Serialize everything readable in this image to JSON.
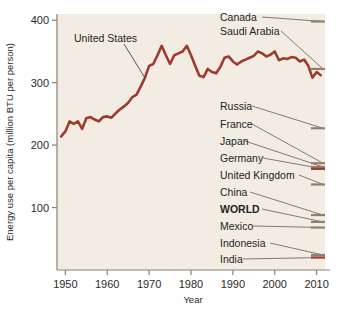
{
  "chart_data": {
    "type": "line",
    "title": "",
    "xlabel": "Year",
    "ylabel": "Energy use per capita (million BTU per person)",
    "xlim": [
      1948,
      2012
    ],
    "ylim": [
      0,
      410
    ],
    "xticks": [
      1950,
      1960,
      1970,
      1980,
      1990,
      2000,
      2010
    ],
    "yticks": [
      100,
      200,
      300,
      400
    ],
    "grid": false,
    "legend_position": "right-inline-labels",
    "line_color": "#9e3b2e",
    "plot_background": "#f3ece2",
    "series": [
      {
        "name": "United States",
        "color": "#9e3b2e",
        "x": [
          1949,
          1950,
          1951,
          1952,
          1953,
          1954,
          1955,
          1956,
          1957,
          1958,
          1959,
          1960,
          1961,
          1962,
          1963,
          1964,
          1965,
          1966,
          1967,
          1968,
          1969,
          1970,
          1971,
          1972,
          1973,
          1974,
          1975,
          1976,
          1977,
          1978,
          1979,
          1980,
          1981,
          1982,
          1983,
          1984,
          1985,
          1986,
          1987,
          1988,
          1989,
          1990,
          1991,
          1992,
          1993,
          1994,
          1995,
          1996,
          1997,
          1998,
          1999,
          2000,
          2001,
          2002,
          2003,
          2004,
          2005,
          2006,
          2007,
          2008,
          2009,
          2010,
          2011
        ],
        "values": [
          214,
          222,
          238,
          234,
          238,
          226,
          243,
          245,
          241,
          238,
          245,
          246,
          244,
          251,
          257,
          262,
          268,
          277,
          281,
          294,
          308,
          327,
          330,
          344,
          359,
          344,
          330,
          344,
          347,
          350,
          359,
          344,
          327,
          311,
          309,
          322,
          317,
          315,
          325,
          340,
          342,
          334,
          329,
          334,
          337,
          340,
          343,
          350,
          347,
          342,
          345,
          350,
          336,
          339,
          338,
          341,
          340,
          334,
          337,
          327,
          308,
          317,
          312
        ]
      },
      {
        "name": "Canada",
        "color": "#8c8075",
        "endpoint_value": 398,
        "label_leader": true
      },
      {
        "name": "Saudi Arabia",
        "color": "#8c8075",
        "endpoint_value": 322,
        "label_leader": true
      },
      {
        "name": "Russia",
        "color": "#8c8075",
        "endpoint_value": 227,
        "label_leader": true
      },
      {
        "name": "France",
        "color": "#8c8075",
        "endpoint_value": 171,
        "label_leader": true
      },
      {
        "name": "Japan",
        "color": "#8c8075",
        "endpoint_value": 165,
        "label_leader": true
      },
      {
        "name": "Germany",
        "color": "#9e3b2e",
        "endpoint_value": 162,
        "label_leader": true
      },
      {
        "name": "United Kingdom",
        "color": "#8c8075",
        "endpoint_value": 137,
        "label_leader": true
      },
      {
        "name": "China",
        "color": "#8c8075",
        "endpoint_value": 88,
        "label_leader": true
      },
      {
        "name": "WORLD",
        "color": "#8c8075",
        "endpoint_value": 77,
        "label_leader": true,
        "emphasis": "bold"
      },
      {
        "name": "Mexico",
        "color": "#8c8075",
        "endpoint_value": 68,
        "label_leader": true
      },
      {
        "name": "Indonesia",
        "color": "#8c8075",
        "endpoint_value": 24,
        "label_leader": true
      },
      {
        "name": "India",
        "color": "#9e3b2e",
        "endpoint_value": 20,
        "label_leader": true
      }
    ]
  },
  "axes": {
    "y_axis_title": "Energy use per capita (million BTU per person)",
    "x_axis_title": "Year",
    "y_tick_labels": [
      "400",
      "300",
      "200",
      "100"
    ],
    "x_tick_labels": [
      "1950",
      "1960",
      "1970",
      "1980",
      "1990",
      "2000",
      "2010"
    ]
  },
  "annotations": {
    "united_states": "United States",
    "canada": "Canada",
    "saudi_arabia": "Saudi Arabia",
    "russia": "Russia",
    "france": "France",
    "japan": "Japan",
    "germany": "Germany",
    "united_kingdom": "United Kingdom",
    "china": "China",
    "world": "WORLD",
    "mexico": "Mexico",
    "indonesia": "Indonesia",
    "india": "India"
  },
  "colors": {
    "line": "#9e3b2e",
    "plot_bg": "#f3ece2",
    "axis": "#8b8178",
    "leader": "#6f665e",
    "text": "#231f1d"
  }
}
